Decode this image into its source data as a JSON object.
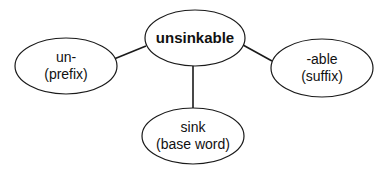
{
  "diagram": {
    "center": {
      "label": "unsinkable"
    },
    "nodes": [
      {
        "id": "prefix",
        "line1": "un-",
        "line2": "(prefix)"
      },
      {
        "id": "base",
        "line1": "sink",
        "line2": "(base word)"
      },
      {
        "id": "suffix",
        "line1": "-able",
        "line2": "(suffix)"
      }
    ],
    "edges": [
      {
        "from": "unsinkable",
        "to": "un-"
      },
      {
        "from": "unsinkable",
        "to": "sink"
      },
      {
        "from": "unsinkable",
        "to": "-able"
      }
    ]
  }
}
